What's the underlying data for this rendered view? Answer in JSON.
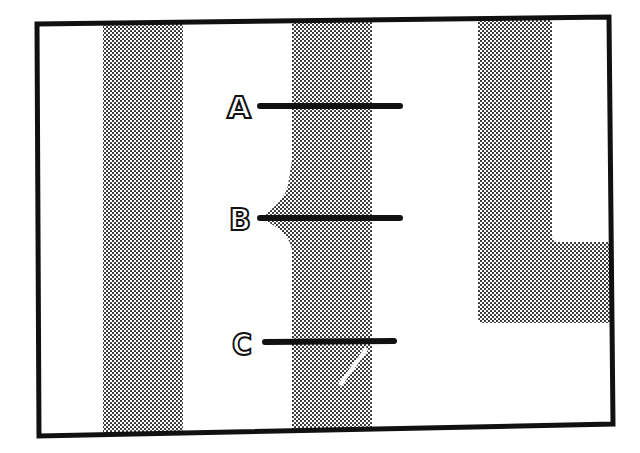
{
  "diagram": {
    "colors": {
      "background": "#ffffff",
      "frame": "#111111",
      "shade_dot": "#222222",
      "line": "#111111",
      "label_fill": "#ffffff",
      "label_stroke": "#111111"
    },
    "labels": [
      {
        "id": "A",
        "text": "A",
        "y": 106
      },
      {
        "id": "B",
        "text": "B",
        "y": 218
      },
      {
        "id": "C",
        "text": "C",
        "y": 342
      }
    ],
    "regions": [
      {
        "id": "stripe-left",
        "description": "shaded vertical stripe"
      },
      {
        "id": "stripe-middle",
        "description": "shaded vertical stripe with bulge at B and notch near C"
      },
      {
        "id": "stripe-right-l",
        "description": "shaded L-shaped region"
      }
    ]
  }
}
